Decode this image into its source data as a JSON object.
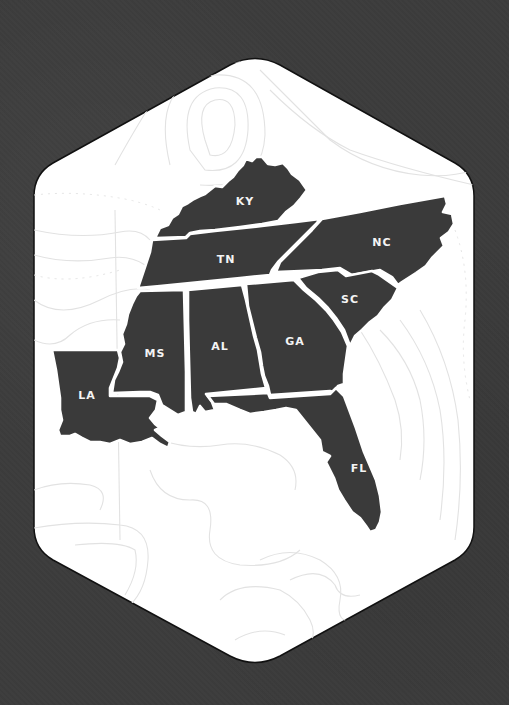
{
  "map": {
    "region": "Southeastern United States",
    "frame_shape": "rounded hexagon",
    "colors": {
      "background": "#3c3c3c",
      "frame_fill": "#ffffff",
      "frame_stroke": "#111111",
      "state_fill": "#3a3a3a",
      "state_border": "#ffffff",
      "label": "#f4f4f4",
      "topo_lines": "#e2e2e2"
    },
    "states": [
      {
        "abbr": "KY",
        "name": "Kentucky"
      },
      {
        "abbr": "TN",
        "name": "Tennessee"
      },
      {
        "abbr": "NC",
        "name": "North Carolina"
      },
      {
        "abbr": "SC",
        "name": "South Carolina"
      },
      {
        "abbr": "MS",
        "name": "Mississippi"
      },
      {
        "abbr": "AL",
        "name": "Alabama"
      },
      {
        "abbr": "GA",
        "name": "Georgia"
      },
      {
        "abbr": "LA",
        "name": "Louisiana"
      },
      {
        "abbr": "FL",
        "name": "Florida"
      }
    ]
  }
}
